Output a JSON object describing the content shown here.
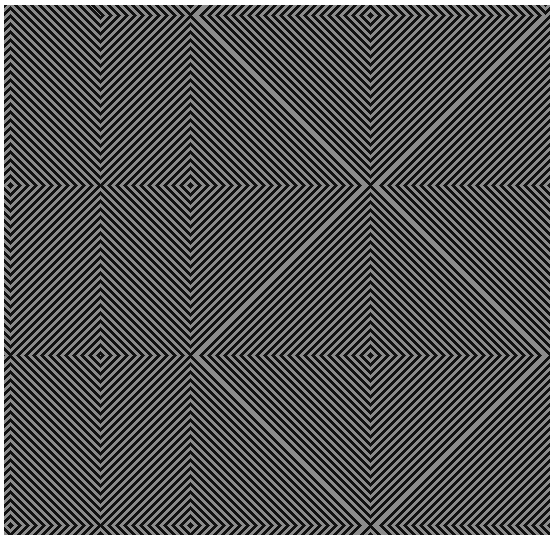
{
  "artwork": {
    "description": "Op-art pattern of concentric diamonds and chevron stripes",
    "colors": {
      "stripe_dark": "#111111",
      "stripe_light": "#8c8c8c",
      "border": "#ffffff"
    },
    "diamond_centers": [
      [
        186,
        180
      ],
      [
        366,
        350
      ],
      [
        6,
        180
      ],
      [
        546,
        180
      ],
      [
        186,
        520
      ],
      [
        366,
        10
      ],
      [
        546,
        520
      ],
      [
        6,
        520
      ],
      [
        186,
        -160
      ],
      [
        366,
        690
      ]
    ]
  }
}
